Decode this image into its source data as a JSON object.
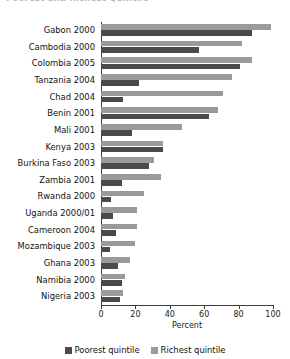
{
  "title": {
    "text": "Poorest and Richest Quintile",
    "state": "cropped-illegible"
  },
  "legend": {
    "poorest_label": "Poorest quintile",
    "richest_label": "Richest quintile",
    "poorest_color": "#4a4a4a",
    "richest_color": "#9a9a9a"
  },
  "axis": {
    "x_title": "Percent",
    "ticks": [
      "0",
      "20",
      "40",
      "60",
      "80",
      "100"
    ]
  },
  "chart_data": {
    "type": "bar",
    "orientation": "horizontal",
    "title": "Poorest and Richest Quintile",
    "xlabel": "Percent",
    "ylabel": "",
    "xlim": [
      0,
      100
    ],
    "xticks": [
      0,
      20,
      40,
      60,
      80,
      100
    ],
    "grid": false,
    "legend_position": "bottom-center",
    "categories": [
      "Gabon 2000",
      "Cambodia 2000",
      "Colombia 2005",
      "Tanzania 2004",
      "Chad 2004",
      "Benin 2001",
      "Mali 2001",
      "Kenya 2003",
      "Burkina Faso 2003",
      "Zambia 2001",
      "Rwanda 2000",
      "Uganda 2000/01",
      "Cameroon 2004",
      "Mozambique 2003",
      "Ghana 2003",
      "Namibia 2000",
      "Nigeria 2003"
    ],
    "series": [
      {
        "name": "Poorest quintile",
        "color": "#4a4a4a",
        "values": [
          88,
          57,
          81,
          22,
          13,
          63,
          18,
          36,
          28,
          12,
          6,
          7,
          9,
          5,
          10,
          12,
          11
        ]
      },
      {
        "name": "Richest quintile",
        "color": "#9a9a9a",
        "values": [
          99,
          82,
          88,
          76,
          71,
          68,
          47,
          36,
          31,
          35,
          25,
          21,
          21,
          20,
          17,
          14,
          13
        ]
      }
    ]
  }
}
